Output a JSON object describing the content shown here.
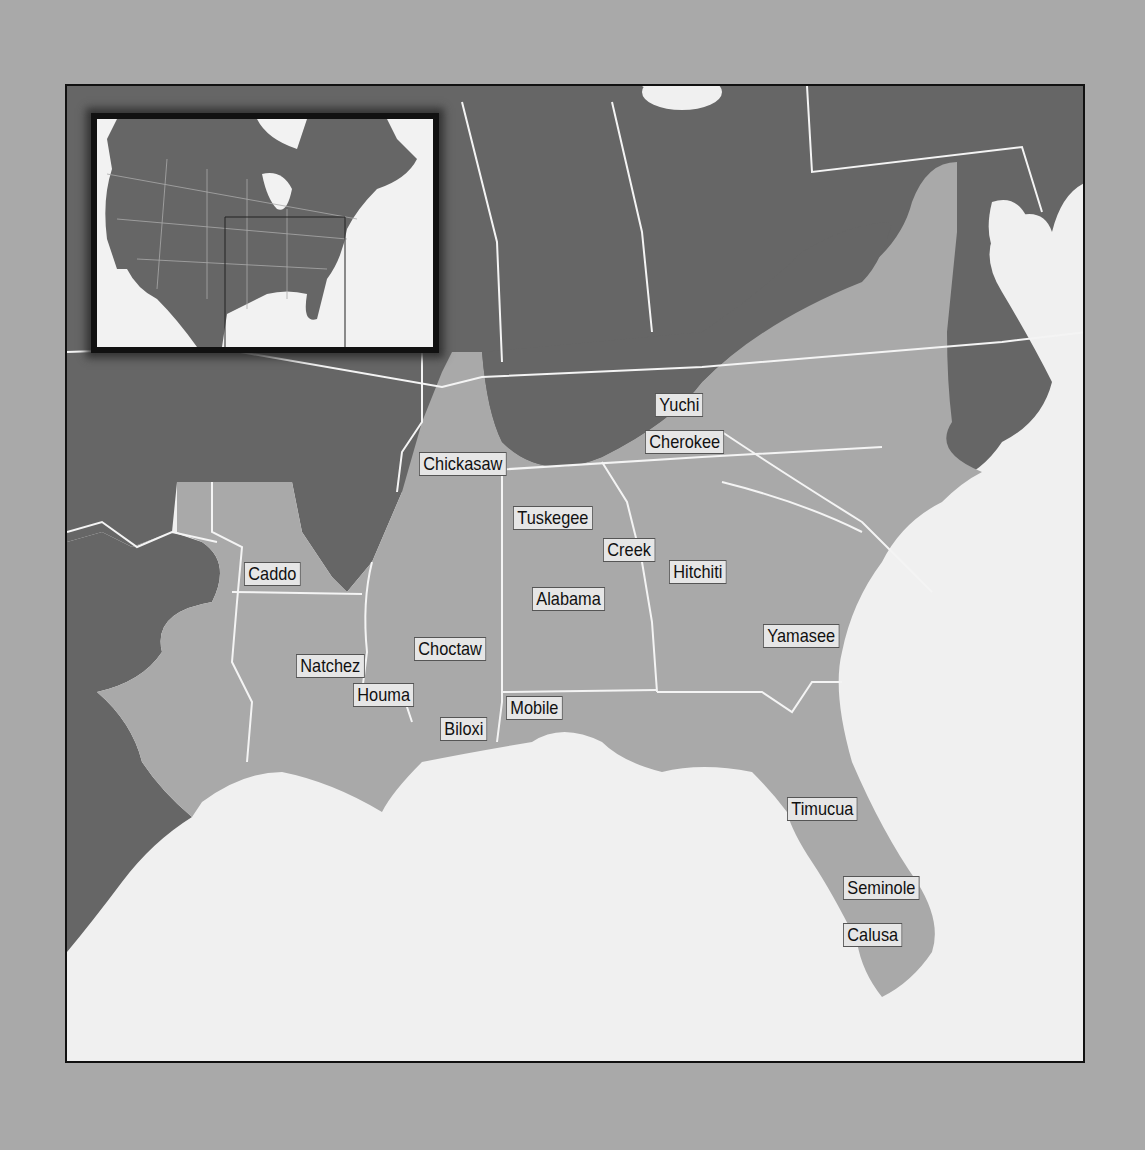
{
  "map": {
    "title": "Southeastern Native American Cultures",
    "colors": {
      "background_page": "#a9a9a9",
      "water": "#f0f0f0",
      "land_outside_region": "#666666",
      "culture_region": "#a9a9a9",
      "borders": "#f4f4f4",
      "frame": "#111111"
    },
    "inset": {
      "description": "Locator map of North America with the southeastern United States outlined"
    },
    "labels": [
      {
        "id": "yuchi",
        "text": "Yuchi",
        "x": 655,
        "y": 393
      },
      {
        "id": "cherokee",
        "text": "Cherokee",
        "x": 645,
        "y": 430
      },
      {
        "id": "chickasaw",
        "text": "Chickasaw",
        "x": 419,
        "y": 452
      },
      {
        "id": "tuskegee",
        "text": "Tuskegee",
        "x": 513,
        "y": 506
      },
      {
        "id": "creek",
        "text": "Creek",
        "x": 603,
        "y": 538
      },
      {
        "id": "hitchiti",
        "text": "Hitchiti",
        "x": 669,
        "y": 560
      },
      {
        "id": "caddo",
        "text": "Caddo",
        "x": 244,
        "y": 562
      },
      {
        "id": "alabama",
        "text": "Alabama",
        "x": 532,
        "y": 587
      },
      {
        "id": "yamasee",
        "text": "Yamasee",
        "x": 763,
        "y": 624
      },
      {
        "id": "choctaw",
        "text": "Choctaw",
        "x": 414,
        "y": 637
      },
      {
        "id": "natchez",
        "text": "Natchez",
        "x": 296,
        "y": 654
      },
      {
        "id": "houma",
        "text": "Houma",
        "x": 353,
        "y": 683
      },
      {
        "id": "mobile",
        "text": "Mobile",
        "x": 506,
        "y": 696
      },
      {
        "id": "biloxi",
        "text": "Biloxi",
        "x": 440,
        "y": 717
      },
      {
        "id": "timucua",
        "text": "Timucua",
        "x": 787,
        "y": 797
      },
      {
        "id": "seminole",
        "text": "Seminole",
        "x": 843,
        "y": 876
      },
      {
        "id": "calusa",
        "text": "Calusa",
        "x": 843,
        "y": 923
      }
    ]
  }
}
